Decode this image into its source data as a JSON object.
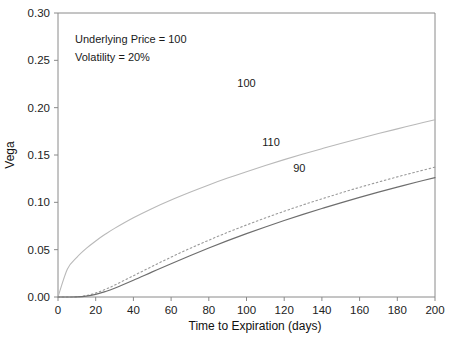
{
  "chart_data": {
    "type": "line",
    "title": "",
    "xlabel": "Time to Expiration (days)",
    "ylabel": "Vega",
    "xlim": [
      0,
      200
    ],
    "ylim": [
      0.0,
      0.3
    ],
    "xticks": [
      0,
      20,
      40,
      60,
      80,
      100,
      120,
      140,
      160,
      180,
      200
    ],
    "xticklabels": [
      "0",
      "20",
      "40",
      "60",
      "80",
      "100",
      "120",
      "140",
      "160",
      "180",
      "200"
    ],
    "yticks": [
      0.0,
      0.05,
      0.1,
      0.15,
      0.2,
      0.25,
      0.3
    ],
    "yticklabels": [
      "0.00",
      "0.05",
      "0.10",
      "0.15",
      "0.20",
      "0.25",
      "0.30"
    ],
    "grid": false,
    "legend_position": "inline-curve-labels",
    "annotations": [
      "Underlying Price = 100",
      "Volatility = 20%"
    ],
    "x": [
      0,
      5,
      10,
      15,
      20,
      25,
      30,
      40,
      50,
      60,
      70,
      80,
      90,
      100,
      110,
      120,
      130,
      140,
      150,
      160,
      170,
      180,
      190,
      200
    ],
    "series": [
      {
        "name": "100",
        "label": "100",
        "linestyle": "solid-light",
        "color": "#b9b9b9",
        "values": [
          0.0,
          0.0296,
          0.0419,
          0.0513,
          0.0592,
          0.0662,
          0.0725,
          0.0837,
          0.0936,
          0.1025,
          0.1107,
          0.1184,
          0.1256,
          0.1324,
          0.1389,
          0.1451,
          0.151,
          0.1567,
          0.1622,
          0.1675,
          0.1727,
          0.1776,
          0.1825,
          0.1872
        ],
        "label_x": 100,
        "label_y": 0.222
      },
      {
        "name": "110",
        "label": "110",
        "linestyle": "dotted",
        "color": "#9a9a9a",
        "values": [
          0.0,
          0.0,
          0.0002,
          0.0015,
          0.0042,
          0.008,
          0.0125,
          0.0224,
          0.0324,
          0.0421,
          0.0513,
          0.06,
          0.0683,
          0.0761,
          0.0835,
          0.0906,
          0.0973,
          0.1037,
          0.1099,
          0.1158,
          0.1214,
          0.1269,
          0.1321,
          0.1372
        ],
        "label_x": 113,
        "label_y": 0.16
      },
      {
        "name": "90",
        "label": "90",
        "linestyle": "solid-dark",
        "color": "#6e6e6e",
        "values": [
          0.0,
          0.0,
          0.0001,
          0.0009,
          0.0028,
          0.0057,
          0.0093,
          0.0177,
          0.0265,
          0.0352,
          0.0436,
          0.0517,
          0.0595,
          0.0669,
          0.074,
          0.0808,
          0.0873,
          0.0935,
          0.0995,
          0.1052,
          0.1107,
          0.116,
          0.1212,
          0.1261
        ],
        "label_x": 128,
        "label_y": 0.132
      }
    ]
  },
  "axes": {
    "ylabel": "Vega",
    "xlabel": "Time to Expiration (days)"
  },
  "annotation_block": {
    "line1": "Underlying Price = 100",
    "line2": "Volatility = 20%"
  },
  "curve_labels": {
    "atm": "100",
    "otm_call": "110",
    "itm_call": "90"
  }
}
